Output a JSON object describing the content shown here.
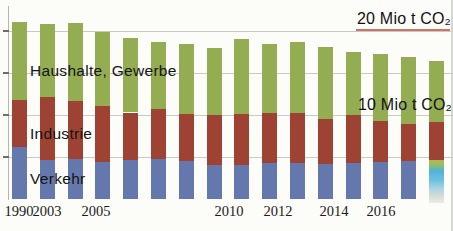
{
  "annotations": {
    "line20": "20 Mio t CO₂",
    "line10": "10 Mio t CO₂"
  },
  "plot_labels": {
    "haushalte": "Haushalte, Gewerbe",
    "industrie": "Industrie",
    "verkehr": "Verkehr"
  },
  "x_axis": {
    "ticks": [
      {
        "label": "1990",
        "x": 19
      },
      {
        "label": "2003",
        "x": 47
      },
      {
        "label": "2005",
        "x": 96
      },
      {
        "label": "2010",
        "x": 229
      },
      {
        "label": "2012",
        "x": 278
      },
      {
        "label": "2014",
        "x": 334
      },
      {
        "label": "2016",
        "x": 381
      }
    ]
  },
  "chart_data": {
    "type": "bar",
    "stacked": true,
    "unit": "Mio t CO2",
    "title": "",
    "xlabel": "",
    "ylabel": "Mio t CO2",
    "ylim": [
      0,
      22
    ],
    "gridlines": [
      5,
      10,
      15,
      20
    ],
    "grid": true,
    "legend_position": "labels inside plot",
    "categories": [
      "1990",
      "2003",
      "2004",
      "2005",
      "2006",
      "2007",
      "2008",
      "2009",
      "2010",
      "2011",
      "2012",
      "2013",
      "2014",
      "2015",
      "2016",
      "2017"
    ],
    "series": [
      {
        "name": "Verkehr",
        "color": "#6478ae",
        "values": [
          6.2,
          4.7,
          4.8,
          4.4,
          4.6,
          4.8,
          4.5,
          4.0,
          4.0,
          4.3,
          4.3,
          4.2,
          4.3,
          4.4,
          4.5,
          4.6
        ]
      },
      {
        "name": "Industrie",
        "color": "#9e4334",
        "values": [
          5.6,
          7.4,
          6.9,
          6.7,
          5.7,
          5.9,
          5.6,
          6.0,
          6.1,
          5.9,
          5.9,
          5.3,
          5.7,
          4.9,
          4.4,
          4.6
        ]
      },
      {
        "name": "Haushalte, Gewerbe",
        "color": "#94ac52",
        "values": [
          9.3,
          8.7,
          9.2,
          8.8,
          8.9,
          8.0,
          8.4,
          8.0,
          8.9,
          8.3,
          8.5,
          8.6,
          7.5,
          8.0,
          8.0,
          7.2
        ]
      }
    ],
    "totals": [
      21.1,
      20.8,
      20.9,
      19.9,
      19.2,
      18.7,
      18.5,
      18.0,
      19.0,
      18.5,
      18.7,
      18.1,
      17.5,
      17.3,
      16.9,
      16.4
    ]
  },
  "print_artifact": {
    "bar_index": 15,
    "colors": [
      "#b2b84e",
      "#4fb3da",
      "#ecede6"
    ]
  },
  "colors": {
    "background": "#fcfcf9",
    "gridline": "#c8c8c4",
    "text": "#141414",
    "underline_red": "#bb3a26"
  }
}
